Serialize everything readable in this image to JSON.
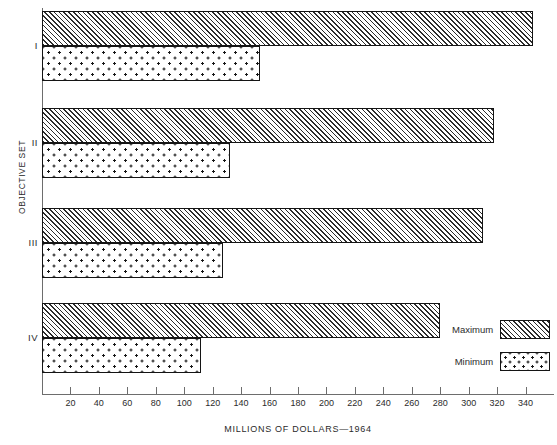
{
  "chart_data": {
    "type": "bar",
    "orientation": "horizontal",
    "title": "",
    "xlabel": "MILLIONS OF DOLLARS—1964",
    "ylabel": "OBJECTIVE SET",
    "categories": [
      "I",
      "II",
      "III",
      "IV"
    ],
    "series": [
      {
        "name": "Maximum",
        "values": [
          345,
          318,
          310,
          280
        ]
      },
      {
        "name": "Minimum",
        "values": [
          153,
          132,
          127,
          112
        ]
      }
    ],
    "xlim": [
      0,
      360
    ],
    "xticks": [
      20,
      40,
      60,
      80,
      100,
      120,
      140,
      160,
      180,
      200,
      220,
      240,
      260,
      280,
      300,
      320,
      340
    ],
    "grid": false,
    "legend_position": "inside-bottom-right",
    "legend": [
      "Maximum",
      "Minimum"
    ]
  },
  "legend": {
    "maximum_label": "Maximum",
    "minimum_label": "Minimum"
  },
  "colors": {
    "axis": "#6d6d6d",
    "bar_outline": "#141414",
    "hatch": "#2c2c2c",
    "dots": "#161616",
    "text": "#2b2b2b",
    "background": "#ffffff"
  }
}
